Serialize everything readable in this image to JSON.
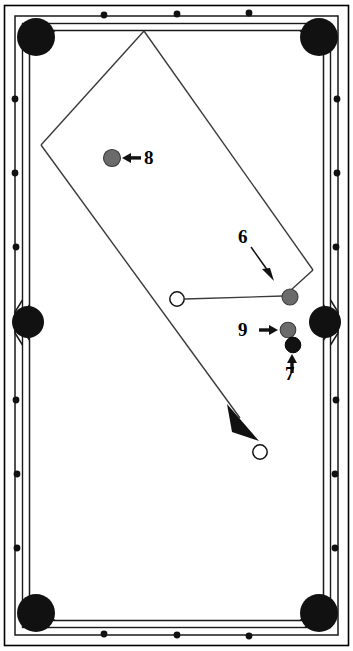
{
  "diagram": {
    "kind": "pool-table-shot-diagram",
    "orientation": "portrait",
    "width": 353,
    "height": 651,
    "colors": {
      "outline": "#000000",
      "cloth": "#ffffff",
      "rail": "#ffffff",
      "pocket": "#111111",
      "diamond": "#111111",
      "object_ball_gray": "#6b6b6b",
      "object_ball_black": "#111111",
      "cue_ball_fill": "#ffffff",
      "path_line": "#3a3a3a"
    },
    "table": {
      "frame": {
        "x": 4,
        "y": 5,
        "width": 345,
        "height": 641
      },
      "rail_outer": {
        "x": 15,
        "y": 16,
        "width": 323,
        "height": 619
      },
      "rail_inner": {
        "x": 22,
        "y": 23,
        "width": 309,
        "height": 605
      },
      "playfield": {
        "x": 29,
        "y": 30,
        "width": 295,
        "height": 591
      }
    },
    "pockets": [
      {
        "name": "pocket-top-left",
        "cx": 36,
        "cy": 37,
        "r": 19
      },
      {
        "name": "pocket-top-right",
        "cx": 319,
        "cy": 37,
        "r": 19
      },
      {
        "name": "pocket-side-left",
        "cx": 29,
        "cy": 322,
        "r": 16
      },
      {
        "name": "pocket-side-right",
        "cx": 325,
        "cy": 322,
        "r": 16
      },
      {
        "name": "pocket-bottom-left",
        "cx": 36,
        "cy": 613,
        "r": 19
      },
      {
        "name": "pocket-bottom-right",
        "cx": 319,
        "cy": 613,
        "r": 19
      }
    ],
    "diamonds": {
      "radius": 3.4,
      "top": [
        {
          "cx": 104,
          "cy": 15
        },
        {
          "cx": 177,
          "cy": 14
        },
        {
          "cx": 249,
          "cy": 13
        }
      ],
      "bottom": [
        {
          "cx": 104,
          "cy": 634
        },
        {
          "cx": 177,
          "cy": 635
        },
        {
          "cx": 249,
          "cy": 636
        }
      ],
      "left": [
        {
          "cx": 15,
          "cy": 99
        },
        {
          "cx": 15,
          "cy": 173
        },
        {
          "cx": 16,
          "cy": 247
        },
        {
          "cx": 16,
          "cy": 400
        },
        {
          "cx": 17,
          "cy": 474
        },
        {
          "cx": 17,
          "cy": 548
        }
      ],
      "right": [
        {
          "cx": 337,
          "cy": 99
        },
        {
          "cx": 337,
          "cy": 173
        },
        {
          "cx": 336,
          "cy": 247
        },
        {
          "cx": 336,
          "cy": 400
        },
        {
          "cx": 335,
          "cy": 474
        },
        {
          "cx": 335,
          "cy": 548
        }
      ]
    },
    "balls": [
      {
        "name": "object-ball-8",
        "number": "8",
        "cx": 112,
        "cy": 158,
        "r": 8.5,
        "kind": "gray"
      },
      {
        "name": "object-ball-6",
        "number": "6",
        "cx": 290,
        "cy": 297,
        "r": 8.0,
        "kind": "gray"
      },
      {
        "name": "object-ball-9",
        "number": "9",
        "cx": 288,
        "cy": 330,
        "r": 7.8,
        "kind": "gray"
      },
      {
        "name": "object-ball-7",
        "number": "7",
        "cx": 293,
        "cy": 345,
        "r": 7.8,
        "kind": "black"
      },
      {
        "name": "cue-ball-start",
        "number": "",
        "cx": 177,
        "cy": 299,
        "r": 7.5,
        "kind": "cue"
      },
      {
        "name": "cue-ball-end",
        "number": "",
        "cx": 260,
        "cy": 452,
        "r": 7.5,
        "kind": "cue"
      }
    ],
    "labels": [
      {
        "id": "label-8",
        "text": "8",
        "ball": "8",
        "arrow": "left-arrow"
      },
      {
        "id": "label-6",
        "text": "6",
        "ball": "6",
        "arrow": "down-right-arrow"
      },
      {
        "id": "label-9",
        "text": "9",
        "ball": "9",
        "arrow": "right-arrow"
      },
      {
        "id": "label-7",
        "text": "7",
        "ball": "7",
        "arrow": "up-arrow"
      }
    ],
    "paths": {
      "cue_to_six": {
        "from": [
          185,
          299
        ],
        "to": [
          283,
          295
        ]
      },
      "six_to_right_vertex": {
        "from": [
          292,
          289
        ],
        "to": [
          313,
          270
        ]
      },
      "right_vertex_to_apex": {
        "from": [
          313,
          270
        ],
        "to": [
          144,
          31
        ]
      },
      "apex_to_left_vertex": {
        "from": [
          144,
          31
        ],
        "to": [
          41,
          145
        ]
      },
      "left_vertex_to_arrow": {
        "from": [
          41,
          145
        ],
        "to": [
          241,
          420
        ]
      },
      "arrowhead": {
        "tip": [
          259,
          441
        ],
        "direction": "down-right"
      }
    },
    "label_arrows": {
      "arrow_8": {
        "from": [
          141,
          158
        ],
        "to": [
          124,
          158
        ]
      },
      "arrow_6": {
        "from": [
          251,
          247
        ],
        "to": [
          272,
          275
        ]
      },
      "arrow_9": {
        "from": [
          261,
          330
        ],
        "to": [
          278,
          330
        ]
      },
      "arrow_7": {
        "from": [
          292,
          373
        ],
        "to": [
          292,
          355
        ]
      }
    }
  }
}
